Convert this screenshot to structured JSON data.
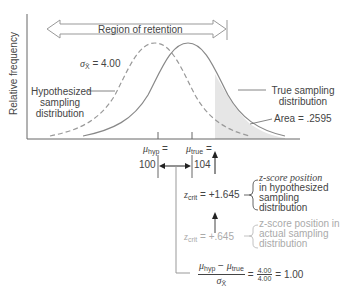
{
  "axis": {
    "y_label": "Relative frequency"
  },
  "region_arrow": {
    "label": "Region of retention"
  },
  "sigma_label": {
    "symbol": "σ",
    "subscript": "X̄",
    "value": "= 4.00"
  },
  "hypothesized": {
    "label_line1": "Hypothesized",
    "label_line2": "sampling",
    "label_line3": "distribution"
  },
  "true_dist": {
    "label_line1": "True sampling",
    "label_line2": "distribution",
    "area_label": "Area = .2595"
  },
  "mu_hyp": {
    "symbol": "μ",
    "subscript": "hyp",
    "eq": "=",
    "value": "100"
  },
  "mu_true": {
    "symbol": "μ",
    "subscript": "true",
    "eq": "=",
    "value": "104"
  },
  "zcrit_hyp": {
    "symbol": "z",
    "subscript": "crit",
    "value": "= +1.645",
    "desc_line1": "z-score position",
    "desc_line2": "in hypothesized",
    "desc_line3": "sampling",
    "desc_line4": "distribution"
  },
  "zcrit_actual": {
    "symbol": "z",
    "subscript": "crit",
    "value": "= +.645",
    "desc_line1": "z-score position in",
    "desc_line2": "actual sampling",
    "desc_line3": "distribution"
  },
  "formula": {
    "num_mu1": "μ",
    "num_sub1": "hyp",
    "minus": " − ",
    "num_mu2": "μ",
    "num_sub2": "true",
    "den_sigma": "σ",
    "den_sub": "X̄",
    "eq1": "=",
    "frac_num": "4.00",
    "frac_den": "4.00",
    "result": "= 1.00"
  },
  "colors": {
    "curve": "#888888",
    "shade": "#e6e6e6",
    "text": "#444444",
    "faded_text": "#aaaaaa"
  }
}
